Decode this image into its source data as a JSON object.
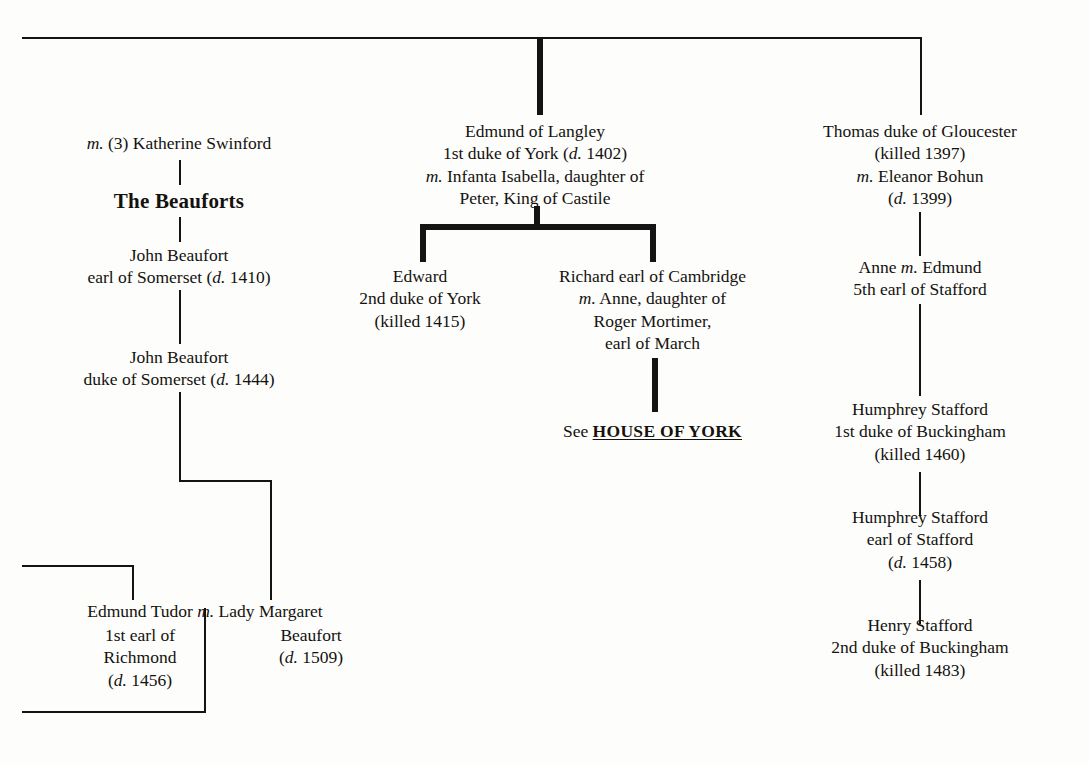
{
  "figure": {
    "kind": "genealogical-tree"
  },
  "nodes": {
    "katherine_swinford": {
      "lines": [
        "m. (3) Katherine Swinford"
      ]
    },
    "beauforts_heading": {
      "lines": [
        "The Beauforts"
      ]
    },
    "john_beaufort_earl": {
      "lines": [
        "John Beaufort",
        "earl of Somerset (d. 1410)"
      ]
    },
    "john_beaufort_duke": {
      "lines": [
        "John Beaufort",
        "duke of Somerset (d. 1444)"
      ]
    },
    "edmund_tudor": {
      "lines": [
        "Edmund Tudor m. Lady Margaret",
        "1st earl of",
        "Richmond",
        "(d. 1456)"
      ]
    },
    "margaret_beaufort": {
      "lines": [
        "Beaufort",
        "(d. 1509)"
      ]
    },
    "edmund_langley": {
      "lines": [
        "Edmund of Langley",
        "1st duke of York (d. 1402)",
        "m. Infanta Isabella, daughter of",
        "Peter, King of Castile"
      ]
    },
    "edward_york": {
      "lines": [
        "Edward",
        "2nd duke of York",
        "(killed 1415)"
      ]
    },
    "richard_cambridge": {
      "lines": [
        "Richard earl of Cambridge",
        "m. Anne, daughter of",
        "Roger Mortimer,",
        "earl of March"
      ]
    },
    "see_house_of_york": {
      "prefix": "See ",
      "link": "HOUSE OF YORK"
    },
    "thomas_gloucester": {
      "lines": [
        "Thomas duke of Gloucester",
        "(killed 1397)",
        "m. Eleanor Bohun",
        "(d. 1399)"
      ]
    },
    "anne_edmund_stafford": {
      "lines": [
        "Anne m. Edmund",
        "5th earl of Stafford"
      ]
    },
    "humphrey_stafford_duke": {
      "lines": [
        "Humphrey Stafford",
        "1st duke of Buckingham",
        "(killed 1460)"
      ]
    },
    "humphrey_stafford_earl": {
      "lines": [
        "Humphrey Stafford",
        "earl of Stafford",
        "(d. 1458)"
      ]
    },
    "henry_stafford": {
      "lines": [
        "Henry Stafford",
        "2nd duke of Buckingham",
        "(killed 1483)"
      ]
    }
  },
  "colors": {
    "ink": "#141414",
    "paper": "#fdfdfb"
  }
}
